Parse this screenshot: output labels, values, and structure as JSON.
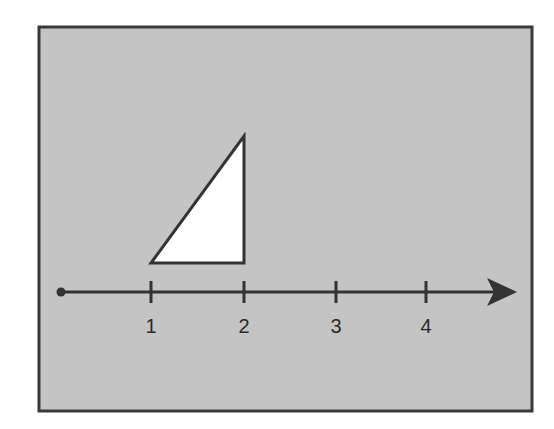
{
  "colors": {
    "panel_fill": "#c4c4c4",
    "frame_stroke": "#3a3a3a",
    "line_stroke": "#333333",
    "triangle_fill": "#ffffff"
  },
  "number_line": {
    "origin_marker": "dot",
    "direction": "right-arrow",
    "ticks": [
      {
        "value": 1,
        "label": "1"
      },
      {
        "value": 2,
        "label": "2"
      },
      {
        "value": 3,
        "label": "3"
      },
      {
        "value": 4,
        "label": "4"
      }
    ]
  },
  "shape": {
    "type": "right-triangle",
    "base_from": 1,
    "base_to": 2,
    "right_angle_at": "bottom-right"
  }
}
